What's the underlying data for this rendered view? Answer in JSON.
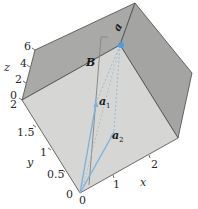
{
  "figure": {
    "type": "3d-box-vector-diagram",
    "axes": {
      "x": {
        "label": "x",
        "ticks": [
          "0",
          "1",
          "2"
        ]
      },
      "y": {
        "label": "y",
        "ticks": [
          "0",
          "0.5",
          "1",
          "1.5",
          "2"
        ]
      },
      "z": {
        "label": "z",
        "ticks": [
          "0",
          "2",
          "4",
          "6"
        ]
      }
    },
    "vectors": [
      {
        "name": "a1",
        "label": "a",
        "subscript": "1",
        "color": "#7fb2dc"
      },
      {
        "name": "a2",
        "label": "a",
        "subscript": "2",
        "color": "#7fb2dc"
      },
      {
        "name": "B",
        "label": "B",
        "subscript": "",
        "color": "#8a8a8a"
      }
    ],
    "top_point_label": "a",
    "colors": {
      "front_face": "#d6d6d4",
      "top_face": "#a9a9a7",
      "right_face": "#a4a4a2",
      "edge": "#4a4a4a",
      "vector_blue": "#7fb2dc",
      "dashed": "#9bbcd6",
      "point": "#4d9be0"
    }
  }
}
